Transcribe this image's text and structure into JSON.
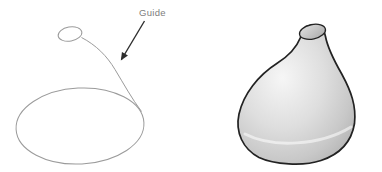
{
  "annotation": {
    "guide_label": "Guide"
  },
  "colors": {
    "page-bg": "#ffffff",
    "sketch-line": "#9b9b9b",
    "arrow": "#2e2e2e",
    "label-text": "#7d7d7d",
    "vase-outline": "#222222",
    "vase-highlight": "#f6f6f6",
    "vase-mid": "#dedede",
    "vase-base": "#c8c8c8",
    "vase-shadow": "#aeaeae",
    "opening-light": "#e2e2e2",
    "opening-dark": "#a9a9a9"
  }
}
